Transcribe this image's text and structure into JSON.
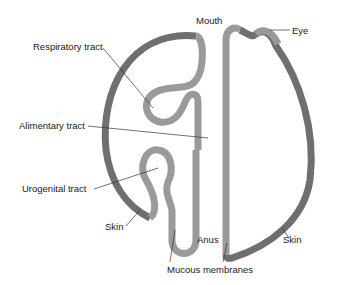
{
  "diagram": {
    "title": "",
    "labels": {
      "mouth": "Mouth",
      "eye": "Eye",
      "respiratory_tract": "Respiratory tract",
      "alimentary_tract": "Alimentary tract",
      "urogenital_tract": "Urogenital tract",
      "skin_left": "Skin",
      "skin_right": "Skin",
      "anus": "Anus",
      "mucous_membranes": "Mucous membranes"
    },
    "colors": {
      "skin": "#6f6f6f",
      "mucous_membrane": "#9a9a9a",
      "leader_line": "#333333",
      "text": "#1a1a1a",
      "background": "#ffffff"
    }
  }
}
